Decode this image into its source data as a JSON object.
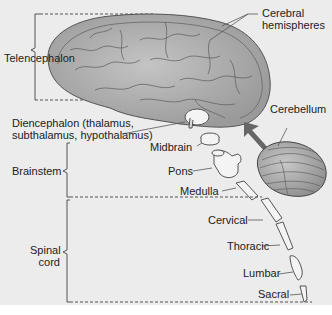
{
  "figure": {
    "background": "#ececec",
    "line_color": "#555555",
    "brain_fill": "#a9a9a9",
    "caption_fragment_top": "",
    "regions": {
      "telencephalon": "Telencephalon",
      "brainstem": "Brainstem",
      "spinal_cord_line1": "Spinal",
      "spinal_cord_line2": "cord"
    },
    "labels": {
      "cerebral_1": "Cerebral",
      "cerebral_2": "hemispheres",
      "cerebellum": "Cerebellum",
      "diencephalon_1": "Diencephalon (thalamus,",
      "diencephalon_2": "subthalamus, hypothalamus)",
      "midbrain": "Midbrain",
      "pons": "Pons",
      "medulla": "Medulla",
      "cervical": "Cervical",
      "thoracic": "Thoracic",
      "lumbar": "Lumbar",
      "sacral": "Sacral"
    }
  }
}
